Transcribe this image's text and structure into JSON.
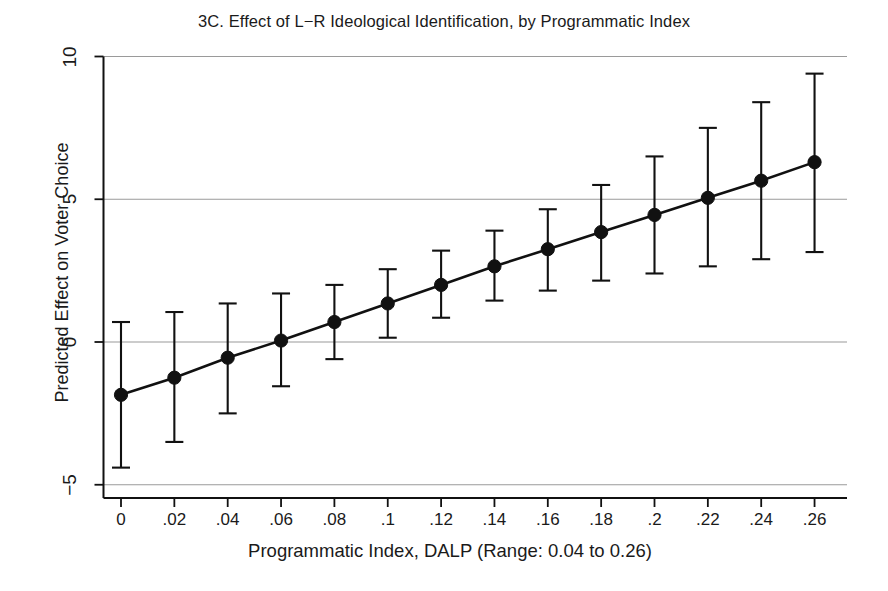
{
  "chart_data": {
    "type": "line",
    "title": "3C. Effect of L−R Ideological Identification, by Programmatic Index",
    "xlabel": "Programmatic Index, DALP (Range: 0.04 to 0.26)",
    "ylabel": "Predicted Effect on Voter Choice",
    "grid": true,
    "legend": "none",
    "xlim": [
      -0.008,
      0.268
    ],
    "ylim": [
      -5,
      10
    ],
    "x_tick_labels": [
      "0",
      ".02",
      ".04",
      ".06",
      ".08",
      ".1",
      ".12",
      ".14",
      ".16",
      ".18",
      ".2",
      ".22",
      ".24",
      ".26"
    ],
    "y_tick_labels": [
      "-5",
      "0",
      "5",
      "10"
    ],
    "y_ticks": [
      -5,
      0,
      5,
      10
    ],
    "x": [
      0,
      0.02,
      0.04,
      0.06,
      0.08,
      0.1,
      0.12,
      0.14,
      0.16,
      0.18,
      0.2,
      0.22,
      0.24,
      0.26
    ],
    "series": [
      {
        "name": "Predicted marginal effect",
        "marker": "filled-circle",
        "values": [
          -1.85,
          -1.25,
          -0.55,
          0.05,
          0.7,
          1.35,
          2.0,
          2.65,
          3.25,
          3.85,
          4.45,
          5.05,
          5.65,
          6.3
        ],
        "ci_low": [
          -4.4,
          -3.5,
          -2.5,
          -1.55,
          -0.6,
          0.15,
          0.85,
          1.45,
          1.8,
          2.15,
          2.4,
          2.65,
          2.9,
          3.15
        ],
        "ci_high": [
          0.7,
          1.05,
          1.35,
          1.7,
          2.0,
          2.55,
          3.2,
          3.9,
          4.65,
          5.5,
          6.5,
          7.5,
          8.4,
          9.4
        ]
      }
    ],
    "colors": {
      "marker": "#111111",
      "line": "#111111",
      "error_bar": "#111111",
      "gridline": "#9a9a9a",
      "axis": "#111111",
      "background": "#ffffff"
    }
  }
}
